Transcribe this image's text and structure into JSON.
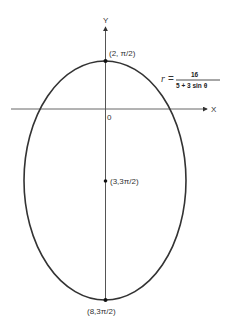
{
  "figure": {
    "axes": {
      "x_label": "X",
      "y_label": "Y",
      "origin_label": "0"
    },
    "equation": {
      "lhs": "r",
      "equals": "=",
      "numerator": "16",
      "denominator": "5 + 3 sin θ"
    },
    "points": [
      {
        "label": "(2, π/2)",
        "role": "vertex-top"
      },
      {
        "label": "(3,3π/2)",
        "role": "center"
      },
      {
        "label": "(8,3π/2)",
        "role": "vertex-bottom"
      }
    ],
    "colors": {
      "curve": "#333333",
      "axis": "#555555",
      "background": "#ffffff"
    }
  }
}
